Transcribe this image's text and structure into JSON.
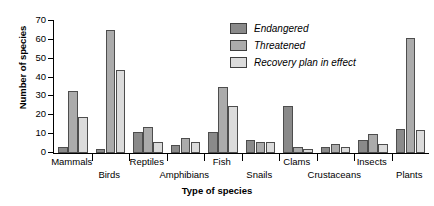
{
  "chart_data": {
    "type": "bar",
    "title": "",
    "xlabel": "Type of species",
    "ylabel": "Number of species",
    "ylim": [
      0,
      70
    ],
    "yticks": [
      0,
      10,
      20,
      30,
      40,
      50,
      60,
      70
    ],
    "grid": false,
    "legend_position": "top-right",
    "categories": [
      "Mammals",
      "Birds",
      "Reptiles",
      "Amphibians",
      "Fish",
      "Snails",
      "Clams",
      "Crustaceans",
      "Insects",
      "Plants"
    ],
    "series": [
      {
        "name": "Endangered",
        "color": "#8a8a8a",
        "values": [
          3,
          2,
          11,
          4,
          11,
          7,
          25,
          3,
          7,
          13
        ]
      },
      {
        "name": "Threatened",
        "color": "#ababab",
        "values": [
          33,
          65,
          14,
          8,
          35,
          6,
          3,
          5,
          10,
          61
        ]
      },
      {
        "name": "Recovery plan in effect",
        "color": "#dbdbdb",
        "values": [
          19,
          44,
          6,
          6,
          25,
          6,
          2,
          3,
          5,
          12
        ]
      }
    ]
  },
  "axes": {
    "y_title": "Number of species",
    "x_title": "Type of species"
  },
  "legend": {
    "items": [
      {
        "label": "Endangered",
        "color": "#8a8a8a"
      },
      {
        "label": "Threatened",
        "color": "#ababab"
      },
      {
        "label": "Recovery plan in effect",
        "color": "#dbdbdb"
      }
    ]
  }
}
